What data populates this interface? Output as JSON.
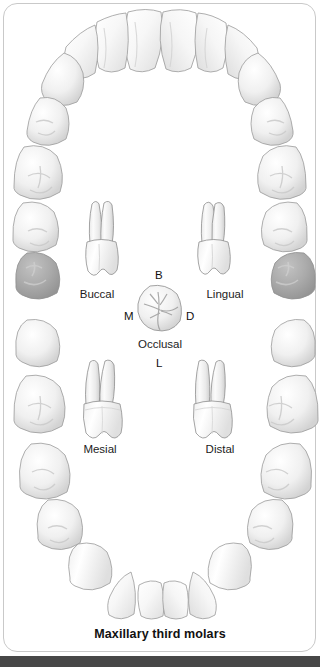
{
  "caption": "Maxillary third molars",
  "views": {
    "buccal": "Buccal",
    "lingual": "Lingual",
    "occlusal": "Occlusal",
    "mesial": "Mesial",
    "distal": "Distal"
  },
  "orientation": {
    "buccal_marker": "B",
    "mesial_marker": "M",
    "distal_marker": "D",
    "lingual_marker": "L"
  },
  "colors": {
    "frame_border": "#c9c9c9",
    "background": "#ffffff",
    "tooth_outline": "#9a9a9a",
    "tooth_fill": "#fbfbfb",
    "highlight_fill": "#a8a8a8",
    "highlight_outline": "#8f8f8f",
    "caption_text": "#111111",
    "bottom_bar": "#474747"
  },
  "arch": {
    "name": "maxillary-dental-arch",
    "highlighted_teeth": [
      "upper-left-third-molar",
      "upper-right-third-molar"
    ],
    "upper_arch_teeth": [
      "central-incisor-left",
      "central-incisor-right",
      "lateral-incisor-left",
      "lateral-incisor-right",
      "canine-left",
      "canine-right",
      "first-premolar-left",
      "first-premolar-right",
      "second-premolar-left",
      "second-premolar-right",
      "first-molar-left",
      "first-molar-right",
      "second-molar-left",
      "second-molar-right",
      "third-molar-left",
      "third-molar-right"
    ]
  }
}
